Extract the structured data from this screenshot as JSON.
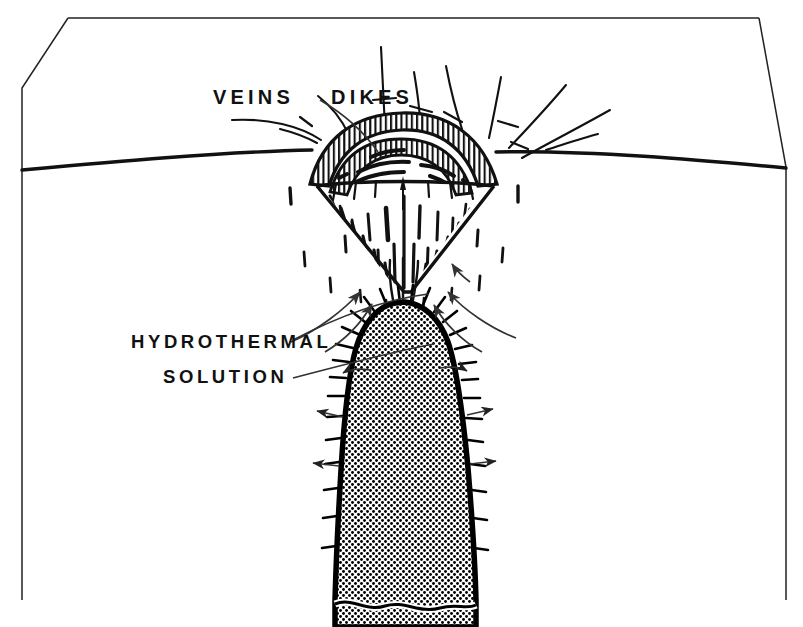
{
  "figure": {
    "kind": "geologic-block-diagram",
    "background_color": "#ffffff",
    "ink_color": "#111111",
    "stipple_color": "#000000"
  },
  "labels": {
    "veins": "VEINS",
    "dikes": "DIKES",
    "hydrothermal": "HYDROTHERMAL",
    "solution": "SOLUTION"
  },
  "annotations": {
    "ground_surface": "ground-surface-line",
    "dome_cap": "hatched-dome-cap",
    "breccia_cone": "inverted-cone-vein-zone",
    "pluton": "stippled-intrusion",
    "flow_arrows": "hydrothermal-flow-arrows",
    "radiating_dikes": "radiating-dike-lines"
  }
}
